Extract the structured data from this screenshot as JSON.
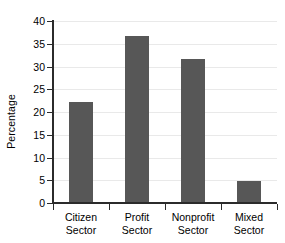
{
  "chart_data": {
    "type": "bar",
    "title": "",
    "xlabel": "",
    "ylabel": "Percentage",
    "categories": [
      "Citizen Sector",
      "Profit Sector",
      "Nonprofit Sector",
      "Mixed Sector"
    ],
    "category_lines": [
      [
        "Citizen",
        "Sector"
      ],
      [
        "Profit",
        "Sector"
      ],
      [
        "Nonprofit",
        "Sector"
      ],
      [
        "Mixed",
        "Sector"
      ]
    ],
    "values": [
      22.2,
      36.6,
      31.7,
      4.9
    ],
    "ylim": [
      0,
      40
    ],
    "ytick_step": 5,
    "ytick_labels": [
      "0",
      "5",
      "10",
      "15",
      "20",
      "25",
      "30",
      "35",
      "40"
    ],
    "grid": true,
    "legend": "none",
    "bar_color": "#575757",
    "axis_color": "#2b2b2b",
    "grid_color": "#e9e9e9",
    "background_color": "#ffffff"
  }
}
